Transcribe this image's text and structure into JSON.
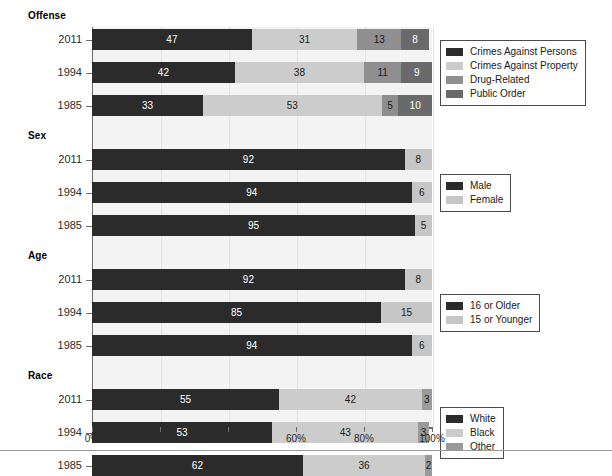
{
  "chart_data": {
    "type": "bar",
    "subtype": "stacked-horizontal-percent",
    "title": "",
    "xlabel": "",
    "ylabel": "",
    "xlim": [
      0,
      100
    ],
    "xticks": [
      "0%",
      "20%",
      "40%",
      "60%",
      "80%",
      "100%"
    ],
    "xtick_values": [
      0,
      20,
      40,
      60,
      80,
      100
    ],
    "grid": true,
    "legend_position": "right",
    "groups": [
      {
        "label": "Offense",
        "categories": [
          "2011",
          "1994",
          "1985"
        ],
        "series": [
          {
            "name": "Crimes Against Persons",
            "color": "#2b2b2b",
            "values": [
              47,
              42,
              33
            ]
          },
          {
            "name": "Crimes Against Property",
            "color": "#cccccc",
            "values": [
              31,
              38,
              53
            ]
          },
          {
            "name": "Drug-Related",
            "color": "#8f8f8f",
            "values": [
              13,
              11,
              5
            ]
          },
          {
            "name": "Public Order",
            "color": "#6a6a6a",
            "values": [
              8,
              9,
              10
            ]
          }
        ]
      },
      {
        "label": "Sex",
        "categories": [
          "2011",
          "1994",
          "1985"
        ],
        "series": [
          {
            "name": "Male",
            "color": "#2b2b2b",
            "values": [
              92,
              94,
              95
            ]
          },
          {
            "name": "Female",
            "color": "#c6c6c6",
            "values": [
              8,
              6,
              5
            ]
          }
        ]
      },
      {
        "label": "Age",
        "categories": [
          "2011",
          "1994",
          "1985"
        ],
        "series": [
          {
            "name": "16 or Older",
            "color": "#2b2b2b",
            "values": [
              92,
              85,
              94
            ]
          },
          {
            "name": "15 or Younger",
            "color": "#c6c6c6",
            "values": [
              8,
              15,
              6
            ]
          }
        ]
      },
      {
        "label": "Race",
        "categories": [
          "2011",
          "1994",
          "1985"
        ],
        "series": [
          {
            "name": "White",
            "color": "#2b2b2b",
            "values": [
              55,
              53,
              62
            ]
          },
          {
            "name": "Black",
            "color": "#cccccc",
            "values": [
              42,
              43,
              36
            ]
          },
          {
            "name": "Other",
            "color": "#9a9a9a",
            "values": [
              3,
              3,
              2
            ]
          }
        ]
      }
    ]
  },
  "colors": {
    "plot_background": "#f3f3f3",
    "axis": "#6d6d6d",
    "gridline": "#e3e3e3",
    "legend_border": "#4a4a4a",
    "dark_series": "#2b2b2b",
    "light_series": "#cccccc",
    "mid_series": "#8f8f8f",
    "darkmid_series": "#6a6a6a"
  }
}
